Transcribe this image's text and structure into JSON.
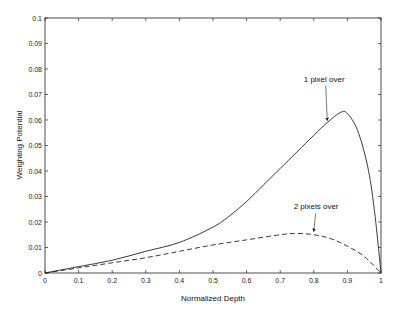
{
  "chart_data": {
    "type": "line",
    "title": "",
    "xlabel": "Normalized Depth",
    "ylabel": "Weighting Potential",
    "xlim": [
      0,
      1
    ],
    "ylim": [
      0,
      0.1
    ],
    "grid": false,
    "legend": "none (inline annotations with arrows)",
    "x_ticks": [
      "0",
      "0.1",
      "0.2",
      "0.3",
      "0.4",
      "0.5",
      "0.6",
      "0.7",
      "0.8",
      "0.9",
      "1"
    ],
    "y_ticks": [
      "0",
      "0.01",
      "0.02",
      "0.03",
      "0.04",
      "0.05",
      "0.06",
      "0.07",
      "0.08",
      "0.09",
      "0.1"
    ],
    "series": [
      {
        "name": "1 pixel over",
        "style": "solid",
        "x": [
          0,
          0.1,
          0.2,
          0.3,
          0.4,
          0.5,
          0.55,
          0.6,
          0.65,
          0.7,
          0.75,
          0.8,
          0.84,
          0.88,
          0.9,
          0.93,
          0.96,
          0.98,
          1.0
        ],
        "values": [
          0,
          0.0025,
          0.005,
          0.0085,
          0.012,
          0.018,
          0.0225,
          0.028,
          0.0345,
          0.041,
          0.0475,
          0.054,
          0.059,
          0.063,
          0.0625,
          0.056,
          0.042,
          0.025,
          0
        ]
      },
      {
        "name": "2 pixels over",
        "style": "dashed",
        "x": [
          0,
          0.1,
          0.2,
          0.3,
          0.4,
          0.5,
          0.6,
          0.7,
          0.75,
          0.8,
          0.85,
          0.9,
          0.95,
          1.0
        ],
        "values": [
          0,
          0.002,
          0.004,
          0.006,
          0.0085,
          0.011,
          0.013,
          0.015,
          0.0155,
          0.015,
          0.0135,
          0.0105,
          0.0065,
          0
        ]
      }
    ],
    "annotations": [
      {
        "text": "1 pixel over",
        "points_to_series": "1 pixel over",
        "text_pos": [
          0.77,
          0.075
        ],
        "arrow_to": [
          0.84,
          0.059
        ]
      },
      {
        "text": "2 pixels over",
        "points_to_series": "2 pixels over",
        "text_pos": [
          0.74,
          0.025
        ],
        "arrow_to": [
          0.8,
          0.0155
        ]
      }
    ]
  }
}
